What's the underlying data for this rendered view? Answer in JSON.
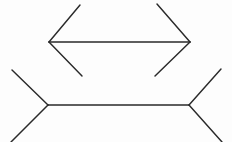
{
  "figure": {
    "type": "line-drawing",
    "width": 232,
    "height": 142,
    "background_color": "#fdfdfd",
    "line_color": "#2a2a2a",
    "line_width": 1.45,
    "shapes": [
      {
        "name": "upper-figure",
        "label": "Upper segment with outward fins",
        "shaft": {
          "x1": 49,
          "y1": 42,
          "x2": 190,
          "y2": 42,
          "length": 141
        },
        "fins": [
          {
            "name": "upper-left-fin-top",
            "x1": 49,
            "y1": 42,
            "x2": 80,
            "y2": 5
          },
          {
            "name": "upper-left-fin-bottom",
            "x1": 49,
            "y1": 42,
            "x2": 82,
            "y2": 76
          },
          {
            "name": "upper-right-fin-top",
            "x1": 190,
            "y1": 42,
            "x2": 157,
            "y2": 4
          },
          {
            "name": "upper-right-fin-bottom",
            "x1": 190,
            "y1": 42,
            "x2": 155,
            "y2": 76
          }
        ]
      },
      {
        "name": "lower-figure",
        "label": "Lower segment with inward fins",
        "shaft": {
          "x1": 48,
          "y1": 105,
          "x2": 189,
          "y2": 105,
          "length": 141
        },
        "fins": [
          {
            "name": "lower-left-fin-top",
            "x1": 48,
            "y1": 105,
            "x2": 12,
            "y2": 70
          },
          {
            "name": "lower-left-fin-bottom",
            "x1": 48,
            "y1": 105,
            "x2": 11,
            "y2": 142
          },
          {
            "name": "lower-right-fin-top",
            "x1": 189,
            "y1": 105,
            "x2": 221,
            "y2": 69
          },
          {
            "name": "lower-right-fin-bottom",
            "x1": 189,
            "y1": 105,
            "x2": 222,
            "y2": 142
          }
        ]
      }
    ]
  }
}
